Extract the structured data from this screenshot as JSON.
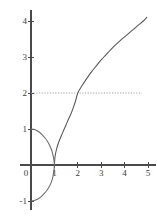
{
  "chart_data": {
    "type": "line",
    "title": "",
    "subtitle": "",
    "xlabel": "",
    "ylabel": "",
    "xlim": [
      -0.45,
      5.35
    ],
    "ylim": [
      -1.25,
      4.3
    ],
    "grid": false,
    "legend": null,
    "axis_style": "two-axis-cross-at-origin",
    "x_ticks": [
      0,
      1,
      2,
      3,
      4,
      5
    ],
    "x_tick_labels": [
      "0",
      "1",
      "2",
      "3",
      "4",
      "5"
    ],
    "y_ticks": [
      -1,
      1,
      2,
      3,
      4
    ],
    "y_tick_labels": [
      "-1",
      "1",
      "2",
      "3",
      "4"
    ],
    "series": [
      {
        "name": "main-curve",
        "type": "line",
        "color": "#555555",
        "points": [
          [
            1.0,
            0.0
          ],
          [
            1.02,
            0.2
          ],
          [
            1.05,
            0.32
          ],
          [
            1.1,
            0.46
          ],
          [
            1.15,
            0.57
          ],
          [
            1.2,
            0.66
          ],
          [
            1.3,
            0.82
          ],
          [
            1.4,
            0.97
          ],
          [
            1.5,
            1.12
          ],
          [
            1.6,
            1.27
          ],
          [
            1.7,
            1.41
          ],
          [
            1.8,
            1.58
          ],
          [
            1.9,
            1.77
          ],
          [
            2.0,
            2.0
          ],
          [
            2.2,
            2.22
          ],
          [
            2.4,
            2.42
          ],
          [
            2.6,
            2.6
          ],
          [
            2.8,
            2.76
          ],
          [
            3.0,
            2.92
          ],
          [
            3.2,
            3.06
          ],
          [
            3.4,
            3.2
          ],
          [
            3.6,
            3.33
          ],
          [
            3.8,
            3.45
          ],
          [
            4.0,
            3.56
          ],
          [
            4.2,
            3.67
          ],
          [
            4.4,
            3.78
          ],
          [
            4.6,
            3.89
          ],
          [
            4.8,
            4.0
          ],
          [
            4.95,
            4.1
          ]
        ]
      },
      {
        "name": "loop-arc",
        "type": "line",
        "color": "#6a6a6a",
        "points": [
          [
            0.0,
            1.0
          ],
          [
            0.12,
            0.99
          ],
          [
            0.24,
            0.96
          ],
          [
            0.36,
            0.91
          ],
          [
            0.48,
            0.84
          ],
          [
            0.6,
            0.75
          ],
          [
            0.7,
            0.66
          ],
          [
            0.78,
            0.57
          ],
          [
            0.86,
            0.45
          ],
          [
            0.92,
            0.33
          ],
          [
            0.96,
            0.21
          ],
          [
            0.99,
            0.08
          ],
          [
            1.0,
            0.0
          ],
          [
            0.99,
            -0.1
          ],
          [
            0.96,
            -0.24
          ],
          [
            0.92,
            -0.37
          ],
          [
            0.86,
            -0.49
          ],
          [
            0.78,
            -0.6
          ],
          [
            0.68,
            -0.7
          ],
          [
            0.57,
            -0.79
          ],
          [
            0.45,
            -0.87
          ],
          [
            0.33,
            -0.93
          ],
          [
            0.2,
            -0.97
          ],
          [
            0.08,
            -0.995
          ],
          [
            0.0,
            -1.0
          ]
        ]
      }
    ],
    "annotations": [
      {
        "name": "horizontal-reference-line",
        "type": "dotted-horizontal",
        "y": 2.0,
        "x_from": 0.0,
        "x_to": 4.75,
        "color": "#8c8c8c"
      }
    ]
  },
  "colors": {
    "axis": "#4a4a4a",
    "curve": "#555555",
    "arc": "#6a6a6a",
    "dotted": "#8c8c8c",
    "label": "#3a3a3a",
    "background": "#ffffff"
  }
}
